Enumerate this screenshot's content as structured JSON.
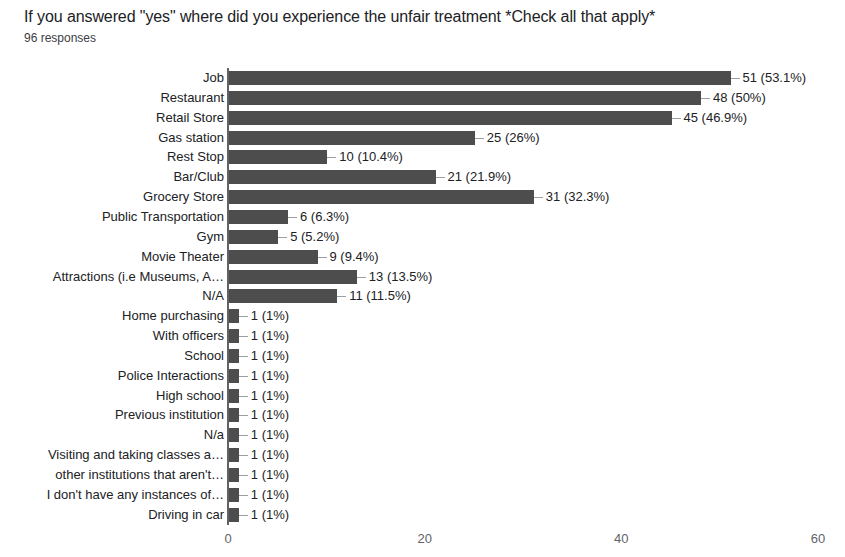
{
  "chart": {
    "title": "If you answered \"yes\" where did you experience the unfair treatment *Check all that apply*",
    "subtitle": "96 responses"
  },
  "chart_data": {
    "type": "bar",
    "orientation": "horizontal",
    "title": "If you answered \"yes\" where did you experience the unfair treatment *Check all that apply*",
    "subtitle": "96 responses",
    "total_responses": 96,
    "xlabel": "",
    "ylabel": "",
    "xlim": [
      0,
      60
    ],
    "xticks": [
      "0",
      "20",
      "40",
      "60"
    ],
    "xtick_values": [
      0,
      20,
      40,
      60
    ],
    "grid": false,
    "legend": false,
    "bar_color": "#4d4d4d",
    "categories": [
      "Job",
      "Restaurant",
      "Retail Store",
      "Gas station",
      "Rest Stop",
      "Bar/Club",
      "Grocery Store",
      "Public Transportation",
      "Gym",
      "Movie Theater",
      "Attractions (i.e Museums, A…",
      "N/A",
      "Home purchasing",
      "With officers",
      "School",
      "Police Interactions",
      "High school",
      "Previous institution",
      "N/a",
      "Visiting and taking classes a…",
      "other institutions that aren't…",
      "I don't have any instances of…",
      "Driving in car"
    ],
    "values": [
      51,
      48,
      45,
      25,
      10,
      21,
      31,
      6,
      5,
      9,
      13,
      11,
      1,
      1,
      1,
      1,
      1,
      1,
      1,
      1,
      1,
      1,
      1
    ],
    "value_labels": [
      "51 (53.1%)",
      "48 (50%)",
      "45 (46.9%)",
      "25 (26%)",
      "10 (10.4%)",
      "21 (21.9%)",
      "31 (32.3%)",
      "6 (6.3%)",
      "5 (5.2%)",
      "9 (9.4%)",
      "13 (13.5%)",
      "11 (11.5%)",
      "1 (1%)",
      "1 (1%)",
      "1 (1%)",
      "1 (1%)",
      "1 (1%)",
      "1 (1%)",
      "1 (1%)",
      "1 (1%)",
      "1 (1%)",
      "1 (1%)",
      "1 (1%)"
    ],
    "percentages": [
      53.1,
      50,
      46.9,
      26,
      10.4,
      21.9,
      32.3,
      6.3,
      5.2,
      9.4,
      13.5,
      11.5,
      1,
      1,
      1,
      1,
      1,
      1,
      1,
      1,
      1,
      1,
      1
    ]
  }
}
